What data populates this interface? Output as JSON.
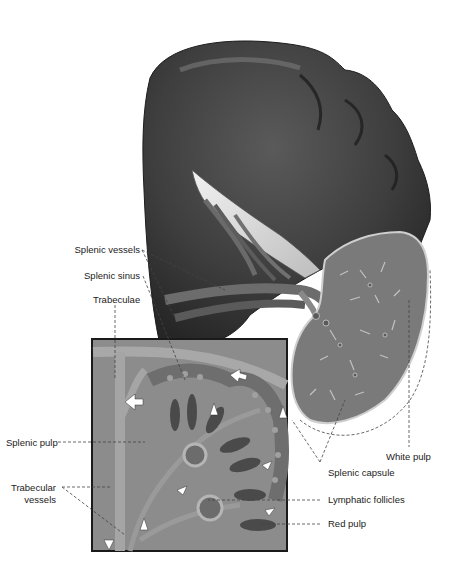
{
  "figure": {
    "colors": {
      "organ_dark": "#3a3a3a",
      "organ_mid": "#555555",
      "section_gray": "#7d7d7d",
      "inset_bg": "#8e8e8e",
      "label_text": "#222222",
      "leader_line": "#444444"
    }
  },
  "labels": {
    "splenic_vessels": "Splenic vessels",
    "splenic_sinus": "Splenic sinus",
    "trabeculae": "Trabeculae",
    "splenic_pulp": "Splenic pulp",
    "trabecular_vessels_line1": "Trabecular",
    "trabecular_vessels_line2": "vessels",
    "white_pulp": "White pulp",
    "splenic_capsule": "Splenic capsule",
    "lymphatic_follicles": "Lymphatic follicles",
    "red_pulp": "Red pulp"
  }
}
